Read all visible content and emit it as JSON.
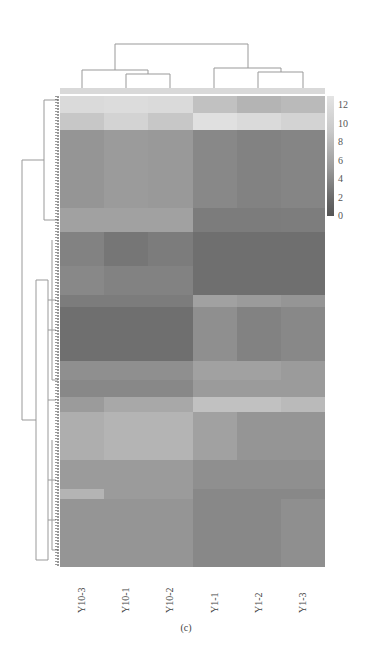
{
  "chart_data": {
    "type": "heatmap",
    "title": "",
    "caption": "(c)",
    "columns": [
      "Y10-3",
      "Y10-1",
      "Y10-2",
      "Y1-1",
      "Y1-2",
      "Y1-3"
    ],
    "column_groups": [
      [
        "Y10-3",
        "Y10-1",
        "Y10-2"
      ],
      [
        "Y1-1",
        "Y1-2",
        "Y1-3"
      ]
    ],
    "colorbar": {
      "min": 0,
      "max": 12,
      "ticks": [
        12,
        10,
        8,
        6,
        4,
        2,
        0
      ],
      "colormap": "grayscale (dark=low, light=high)"
    },
    "row_dendrogram": true,
    "column_dendrogram": true,
    "bands": [
      {
        "rows_frac": 0.035,
        "values": [
          11.0,
          11.2,
          11.0,
          9.0,
          8.0,
          8.5
        ]
      },
      {
        "rows_frac": 0.035,
        "values": [
          9.5,
          10.5,
          9.5,
          11.5,
          11.0,
          10.5
        ]
      },
      {
        "rows_frac": 0.16,
        "values": [
          5.5,
          6.0,
          5.8,
          4.5,
          4.0,
          4.2
        ]
      },
      {
        "rows_frac": 0.05,
        "values": [
          6.5,
          6.5,
          6.5,
          3.5,
          3.5,
          3.6
        ]
      },
      {
        "rows_frac": 0.07,
        "values": [
          4.0,
          3.0,
          3.5,
          2.5,
          2.5,
          2.5
        ]
      },
      {
        "rows_frac": 0.06,
        "values": [
          4.5,
          4.0,
          4.0,
          2.5,
          2.5,
          2.5
        ]
      },
      {
        "rows_frac": 0.025,
        "values": [
          3.5,
          3.5,
          3.5,
          6.5,
          6.0,
          5.5
        ]
      },
      {
        "rows_frac": 0.11,
        "values": [
          2.5,
          2.5,
          2.5,
          5.0,
          4.0,
          4.5
        ]
      },
      {
        "rows_frac": 0.04,
        "values": [
          5.0,
          5.0,
          5.0,
          6.5,
          6.5,
          6.0
        ]
      },
      {
        "rows_frac": 0.035,
        "values": [
          4.5,
          4.5,
          4.5,
          6.0,
          6.0,
          6.0
        ]
      },
      {
        "rows_frac": 0.03,
        "values": [
          6.0,
          7.0,
          7.0,
          9.0,
          9.0,
          8.5
        ]
      },
      {
        "rows_frac": 0.1,
        "values": [
          7.5,
          8.0,
          8.0,
          6.5,
          5.5,
          5.5
        ]
      },
      {
        "rows_frac": 0.06,
        "values": [
          6.0,
          6.0,
          6.0,
          5.0,
          5.0,
          5.0
        ]
      },
      {
        "rows_frac": 0.02,
        "values": [
          8.0,
          6.0,
          6.0,
          4.5,
          4.5,
          4.5
        ]
      },
      {
        "rows_frac": 0.14,
        "values": [
          5.5,
          5.5,
          5.5,
          4.5,
          4.5,
          5.0
        ]
      }
    ]
  },
  "labels": {
    "columns": [
      "Y10-3",
      "Y10-1",
      "Y10-2",
      "Y1-1",
      "Y1-2",
      "Y1-3"
    ],
    "colorbar_ticks": [
      "12",
      "10",
      "8",
      "6",
      "4",
      "2",
      "0"
    ],
    "caption": "(c)"
  }
}
